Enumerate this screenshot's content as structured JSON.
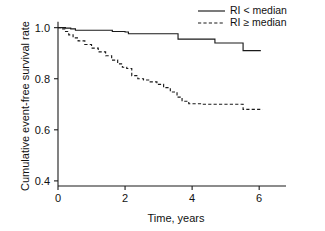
{
  "chart_data": {
    "type": "line",
    "title": "",
    "subtitle": "",
    "xlabel": "Time, years",
    "ylabel": "Cumulative event-free survival rate",
    "xlim": [
      0,
      6.8
    ],
    "ylim": [
      0.38,
      1.03
    ],
    "xticks": [
      0,
      2,
      4,
      6
    ],
    "xtick_labels": [
      "0",
      "2",
      "4",
      "6"
    ],
    "yticks": [
      1.0,
      0.8,
      0.6,
      0.4
    ],
    "ytick_labels": [
      "1.0",
      "0.8",
      "0.6",
      "0.4"
    ],
    "grid": false,
    "legend_position": "top-right",
    "step_style": "post",
    "series": [
      {
        "name": "RI < median",
        "style": "solid",
        "color": "#1a1a1a",
        "x": [
          0.0,
          0.12,
          0.22,
          0.38,
          0.52,
          1.45,
          1.62,
          2.0,
          2.1,
          3.45,
          3.58,
          4.55,
          4.68,
          5.4,
          5.52,
          6.05
        ],
        "y": [
          1.0,
          1.0,
          0.998,
          0.995,
          0.99,
          0.99,
          0.985,
          0.983,
          0.976,
          0.976,
          0.955,
          0.955,
          0.94,
          0.94,
          0.91,
          0.91
        ]
      },
      {
        "name": "RI ≥ median",
        "style": "dashed",
        "color": "#1a1a1a",
        "x": [
          0.0,
          0.1,
          0.2,
          0.32,
          0.45,
          0.6,
          0.8,
          1.0,
          1.2,
          1.42,
          1.6,
          1.78,
          1.92,
          2.05,
          2.2,
          2.38,
          2.55,
          2.75,
          2.95,
          3.15,
          3.35,
          3.55,
          3.7,
          3.9,
          4.3,
          4.8,
          5.2,
          5.4,
          5.52,
          6.1
        ],
        "y": [
          1.0,
          0.995,
          0.985,
          0.972,
          0.96,
          0.948,
          0.934,
          0.92,
          0.905,
          0.89,
          0.873,
          0.858,
          0.845,
          0.84,
          0.812,
          0.8,
          0.795,
          0.788,
          0.778,
          0.765,
          0.748,
          0.728,
          0.712,
          0.702,
          0.7,
          0.7,
          0.7,
          0.7,
          0.68,
          0.68
        ]
      }
    ],
    "legend": [
      {
        "label": "RI < median",
        "style": "solid"
      },
      {
        "label": "RI ≥ median",
        "style": "dashed"
      }
    ]
  }
}
